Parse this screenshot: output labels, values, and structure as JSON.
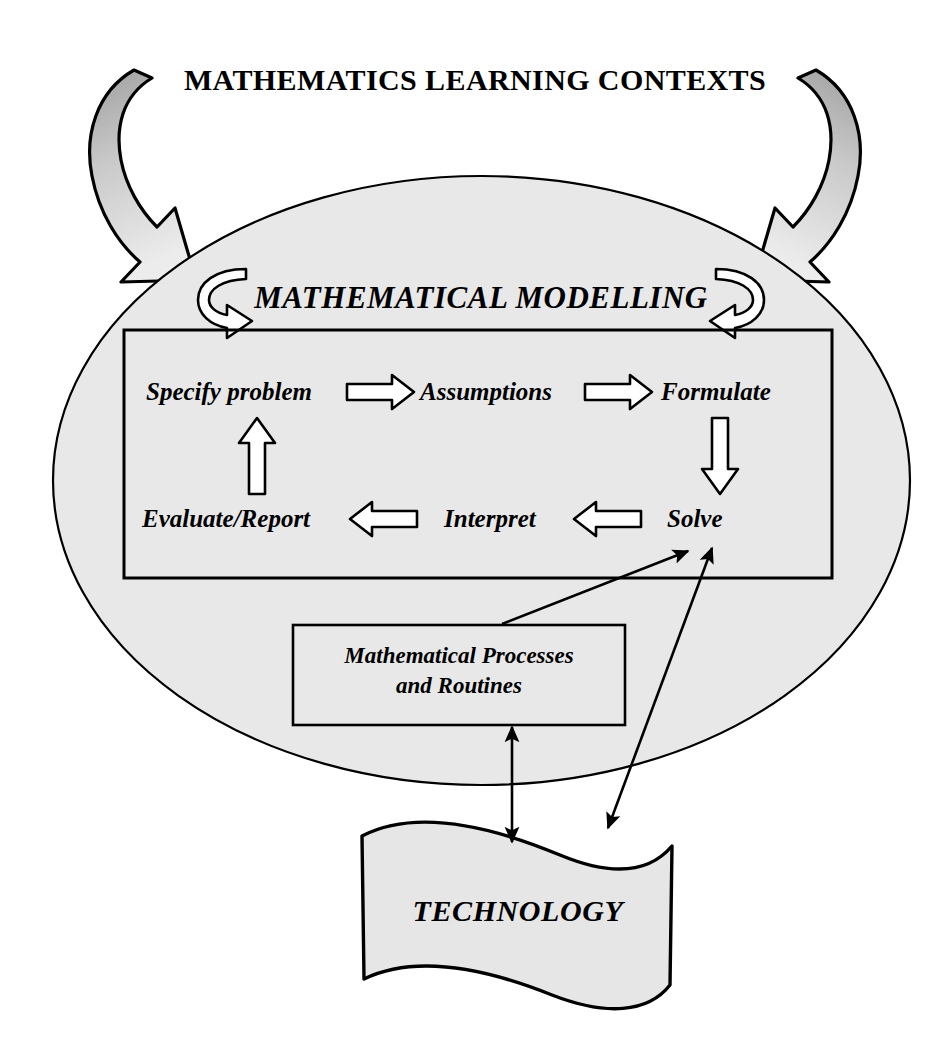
{
  "diagram": {
    "title": "MATHEMATICS LEARNING CONTEXTS",
    "heading": "MATHEMATICAL MODELLING",
    "cycle": {
      "stages": [
        {
          "id": "specify",
          "label": "Specify problem"
        },
        {
          "id": "assume",
          "label": "Assumptions"
        },
        {
          "id": "formulate",
          "label": "Formulate"
        },
        {
          "id": "solve",
          "label": "Solve"
        },
        {
          "id": "interpret",
          "label": "Interpret"
        },
        {
          "id": "evaluate",
          "label": "Evaluate/Report"
        }
      ],
      "connectors": [
        {
          "id": "specify-to-assumptions",
          "from": "Specify problem",
          "to": "Assumptions",
          "style": "block-arrow",
          "direction": "right"
        },
        {
          "id": "assumptions-to-formulate",
          "from": "Assumptions",
          "to": "Formulate",
          "style": "block-arrow",
          "direction": "right"
        },
        {
          "id": "formulate-to-solve",
          "from": "Formulate",
          "to": "Solve",
          "style": "block-arrow",
          "direction": "down"
        },
        {
          "id": "solve-to-interpret",
          "from": "Solve",
          "to": "Interpret",
          "style": "block-arrow",
          "direction": "left"
        },
        {
          "id": "interpret-to-evaluate",
          "from": "Interpret",
          "to": "Evaluate/Report",
          "style": "block-arrow",
          "direction": "left"
        },
        {
          "id": "evaluate-to-specify",
          "from": "Evaluate/Report",
          "to": "Specify problem",
          "style": "block-arrow",
          "direction": "up"
        }
      ]
    },
    "processes_box": {
      "line1": "Mathematical Processes",
      "line2": "and Routines"
    },
    "technology": {
      "label": "TECHNOLOGY"
    },
    "links": [
      {
        "id": "processes-to-solve",
        "from": "Mathematical Processes and Routines",
        "to": "Solve",
        "heads": 1,
        "style": "thin-line"
      },
      {
        "id": "technology-to-solve",
        "from": "TECHNOLOGY",
        "to": "Solve",
        "heads": 2,
        "style": "thin-line"
      },
      {
        "id": "processes-technology",
        "from": "Mathematical Processes and Routines",
        "to": "TECHNOLOGY",
        "heads": 2,
        "style": "thin-line"
      }
    ],
    "context_arrows": [
      {
        "id": "context-arrow-left",
        "side": "left",
        "direction": "into-ellipse"
      },
      {
        "id": "context-arrow-right",
        "side": "right",
        "direction": "into-ellipse"
      }
    ],
    "recursion_arrows": [
      {
        "id": "modelling-loop-left",
        "side": "left"
      },
      {
        "id": "modelling-loop-right",
        "side": "right"
      }
    ],
    "colors": {
      "background": "#ffffff",
      "ellipse_fill": "#e8e8e8",
      "banner_fill": "#e6e6e6",
      "stroke": "#000000",
      "arrow_fill_dark": "#a8a8a8",
      "arrow_fill_light": "#e2e2e2",
      "box_fill": "#e8e8e8"
    }
  }
}
